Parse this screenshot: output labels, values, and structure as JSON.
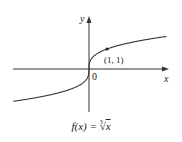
{
  "chart_data": {
    "type": "line",
    "xlabel": "x",
    "ylabel": "y",
    "origin_label": "0",
    "series": [
      {
        "name": "f(x) = cube root of x",
        "function": "x^(1/3)",
        "x": [
          -4.2,
          -3,
          -2,
          -1,
          -0.5,
          -0.1,
          0,
          0.1,
          0.5,
          1,
          2,
          3,
          4.3
        ],
        "values": [
          -1.61,
          -1.44,
          -1.26,
          -1,
          -0.79,
          -0.46,
          0,
          0.46,
          0.79,
          1,
          1.26,
          1.44,
          1.63
        ]
      }
    ],
    "annotations": [
      {
        "x": 1,
        "y": 1,
        "label": "(1, 1)",
        "marker": "dot"
      }
    ],
    "grid": false,
    "legend": "none"
  },
  "labels": {
    "y_axis": "y",
    "x_axis": "x",
    "origin": "0",
    "point": "(1, 1)",
    "caption_prefix": "f(x) = ",
    "caption_index": "3",
    "caption_radicand": "x"
  },
  "colors": {
    "curve": "#333333",
    "axes": "#333333"
  }
}
